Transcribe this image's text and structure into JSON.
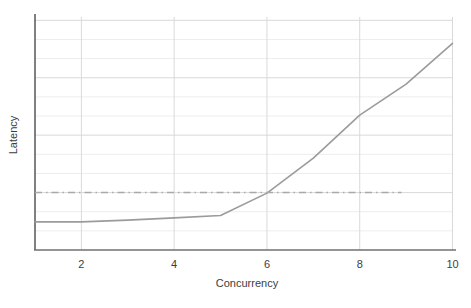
{
  "chart_data": {
    "type": "line",
    "title": "",
    "xlabel": "Concurrency",
    "ylabel": "Latency",
    "x": [
      1,
      2,
      3,
      4,
      5,
      6,
      7,
      8,
      9,
      10
    ],
    "series": [
      {
        "name": "latency-curve",
        "style": "solid",
        "color": "#9b9b9b",
        "width": 1.6,
        "values": [
          0.49,
          0.49,
          0.52,
          0.56,
          0.6,
          0.99,
          1.6,
          2.35,
          2.89,
          3.6
        ]
      },
      {
        "name": "latency-threshold",
        "style": "dashdot",
        "color": "#a9a9a9",
        "width": 1.5,
        "value": 1.0,
        "x_start": 1,
        "x_end": 8.9
      }
    ],
    "xlim": [
      1,
      10
    ],
    "ylim": [
      0,
      4.11
    ],
    "xticks": [
      2,
      4,
      6,
      8,
      10
    ],
    "yticks": [],
    "legend": "none",
    "grid": {
      "vertical_at": [
        2,
        4,
        6,
        8,
        10
      ],
      "horizontal_major_step": 1,
      "horizontal_minor_divisions": 3,
      "major_color": "#d9d9d9",
      "minor_color": "#ededed"
    }
  },
  "colors": {
    "background": "#ffffff",
    "x_axis": "#707070",
    "y_axis": "#4a4a4a",
    "tick_text": "#3d3d3d",
    "label_text": "#3d3d3d"
  }
}
